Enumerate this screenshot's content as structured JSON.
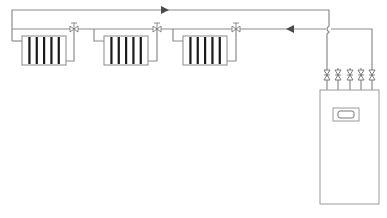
{
  "diagram": {
    "type": "heating-system-schematic",
    "colors": {
      "pipe": "#8c8c8c",
      "radiator_outline": "#8a8a8a",
      "radiator_fin": "#1a1a1a",
      "valve": "#6e6e6e",
      "boiler_outline": "#9a9a9a",
      "arrow": "#4a4a4a"
    },
    "pipes": {
      "supply": {
        "label": "supply-line",
        "y": 10,
        "x_start": 12,
        "x_end": 329,
        "flow_arrow": {
          "x": 165,
          "direction": "right"
        }
      },
      "return": {
        "label": "return-line",
        "y": 29,
        "x_start": 12,
        "x_end": 372,
        "flow_arrow": {
          "x": 290,
          "direction": "left"
        }
      }
    },
    "radiators": [
      {
        "id": "radiator-1",
        "x": 22,
        "y": 36,
        "width": 44,
        "height": 29,
        "fins": 5,
        "valve_x": 74
      },
      {
        "id": "radiator-2",
        "x": 104,
        "y": 36,
        "width": 44,
        "height": 29,
        "fins": 5,
        "valve_x": 157
      },
      {
        "id": "radiator-3",
        "x": 183,
        "y": 36,
        "width": 44,
        "height": 29,
        "fins": 5,
        "valve_x": 236
      }
    ],
    "boiler": {
      "id": "boiler",
      "x": 320,
      "y": 90,
      "width": 59,
      "height": 114,
      "display": {
        "x": 333,
        "y": 108,
        "width": 26,
        "height": 13
      },
      "connection_valves": [
        {
          "x": 327,
          "y": 75
        },
        {
          "x": 338,
          "y": 75
        },
        {
          "x": 350,
          "y": 75
        },
        {
          "x": 361,
          "y": 75
        },
        {
          "x": 372,
          "y": 75
        }
      ]
    }
  },
  "labels": {
    "supply": "Supply flow",
    "return": "Return flow",
    "boiler": "Boiler"
  }
}
